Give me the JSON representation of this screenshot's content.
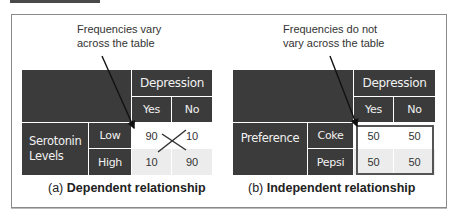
{
  "panels": [
    {
      "id": "a",
      "note": [
        "Frequencies vary",
        "across the table"
      ],
      "column_group_header": "Depression",
      "column_headers": [
        "Yes",
        "No"
      ],
      "row_group_header": [
        "Serotonin",
        "Levels"
      ],
      "row_headers": [
        "Low",
        "High"
      ],
      "cells": [
        [
          "90",
          "10"
        ],
        [
          "10",
          "90"
        ]
      ],
      "caption_prefix": "(a)",
      "caption_title": "Dependent relationship",
      "annotation": "cross-mark-between-cells"
    },
    {
      "id": "b",
      "note": [
        "Frequencies do not",
        "vary across the table"
      ],
      "column_group_header": "Depression",
      "column_headers": [
        "Yes",
        "No"
      ],
      "row_group_header": [
        "Preference"
      ],
      "row_headers": [
        "Coke",
        "Pepsi"
      ],
      "cells": [
        [
          "50",
          "50"
        ],
        [
          "50",
          "50"
        ]
      ],
      "caption_prefix": "(b)",
      "caption_title": "Independent relationship",
      "annotation": "box-around-cells"
    }
  ],
  "colors": {
    "header_dark": "#3b3b3b",
    "header_text": "#f2f2f2",
    "row_light": "#ffffff",
    "row_shaded": "#ececec",
    "frame_border": "#8a8a8a"
  }
}
